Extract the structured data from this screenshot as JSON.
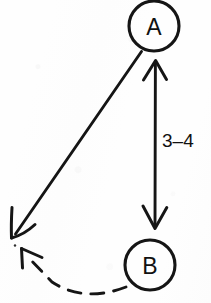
{
  "diagram": {
    "background_color": "#fefefe",
    "ink_color": "#151515",
    "nodes": [
      {
        "id": "A",
        "label": "A",
        "cx": 154,
        "cy": 26,
        "r": 25
      },
      {
        "id": "B",
        "label": "B",
        "cx": 150,
        "cy": 265,
        "r": 25
      }
    ],
    "edges": [
      {
        "id": "a-b-double",
        "label": "3–4",
        "style": "solid",
        "arrowheads": "both",
        "from": "A",
        "to": "B"
      },
      {
        "id": "a-outward",
        "label": "",
        "style": "solid",
        "arrowheads": "end",
        "from": "A",
        "to": "external-left"
      },
      {
        "id": "b-outward-dashed",
        "label": "",
        "style": "dashed",
        "arrowheads": "end",
        "from": "B",
        "to": "external-left"
      }
    ],
    "labels": {
      "distance": "3–4",
      "node_a": "A",
      "node_b": "B"
    }
  }
}
